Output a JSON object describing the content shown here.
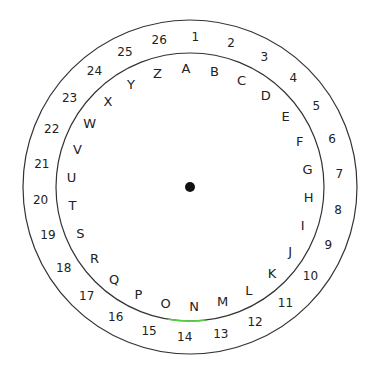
{
  "diagram": {
    "center": {
      "x": 190,
      "y": 187
    },
    "outer_radius": 167,
    "inner_radius": 134,
    "letter_radius": 119,
    "number_radius": 150,
    "stroke_color": "#333333",
    "highlight_color": "#55cc44",
    "letters": [
      "A",
      "B",
      "C",
      "D",
      "E",
      "F",
      "G",
      "H",
      "I",
      "J",
      "K",
      "L",
      "M",
      "N",
      "O",
      "P",
      "Q",
      "R",
      "S",
      "T",
      "U",
      "V",
      "W",
      "X",
      "Y",
      "Z"
    ],
    "numbers": [
      "1",
      "2",
      "3",
      "4",
      "5",
      "6",
      "7",
      "8",
      "9",
      "10",
      "11",
      "12",
      "13",
      "14",
      "15",
      "16",
      "17",
      "18",
      "19",
      "20",
      "21",
      "22",
      "23",
      "24",
      "25",
      "26"
    ]
  }
}
